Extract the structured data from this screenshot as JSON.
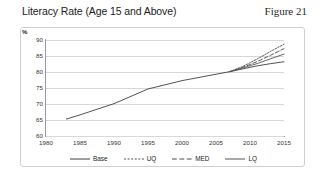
{
  "header": {
    "title": "Literacy Rate (Age 15 and Above)",
    "figure_label": "Figure 21"
  },
  "chart_data": {
    "type": "line",
    "title": "Literacy Rate (Age 15 and Above)",
    "xlabel": "",
    "ylabel": "%",
    "unit_label": "%",
    "xlim": [
      1980,
      2015
    ],
    "ylim": [
      60,
      90
    ],
    "xticks": [
      1980,
      1985,
      1990,
      1995,
      2000,
      2005,
      2010,
      2015
    ],
    "yticks": [
      60,
      65,
      70,
      75,
      80,
      85,
      90
    ],
    "grid": "horizontal",
    "legend_position": "bottom",
    "series": [
      {
        "name": "Base",
        "style": "solid",
        "color": "#3f3f3f",
        "x": [
          1983,
          1985,
          1990,
          1995,
          2000,
          2005,
          2007,
          2009,
          2011,
          2013,
          2015
        ],
        "values": [
          65.3,
          66.6,
          70.1,
          74.7,
          77.3,
          79.3,
          80.1,
          81.0,
          81.9,
          82.6,
          83.2
        ]
      },
      {
        "name": "UQ",
        "style": "dotted",
        "color": "#4a4a4a",
        "x": [
          2007,
          2009,
          2011,
          2013,
          2015
        ],
        "values": [
          80.1,
          81.8,
          84.0,
          86.4,
          88.7
        ]
      },
      {
        "name": "MED",
        "style": "dashed",
        "color": "#4a4a4a",
        "x": [
          2007,
          2009,
          2011,
          2013,
          2015
        ],
        "values": [
          80.1,
          81.5,
          83.2,
          85.2,
          87.3
        ]
      },
      {
        "name": "LQ",
        "style": "solid",
        "color": "#555555",
        "x": [
          2007,
          2009,
          2011,
          2013,
          2015
        ],
        "values": [
          80.1,
          81.3,
          82.6,
          84.1,
          85.6
        ]
      }
    ]
  }
}
